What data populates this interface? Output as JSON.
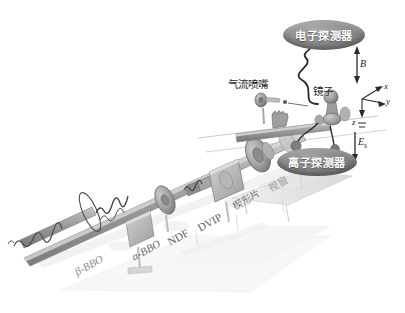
{
  "figure": {
    "kind": "optical-beamline-schematic",
    "background_color": "#ffffff"
  },
  "detectors": [
    {
      "id": "electron",
      "label": "电子探测器",
      "fill_color": "#8e8e8e",
      "text_color": "#ffffff"
    },
    {
      "id": "ion",
      "label": "离子探测器",
      "fill_color": "#878787",
      "text_color": "#ffffff"
    }
  ],
  "annotations": {
    "nozzle": "气流喷嘴",
    "mirror": "镜子",
    "wedge": "楔形片",
    "window": "视窗"
  },
  "optics": [
    {
      "id": "beta-bbo",
      "label": "β-BBO"
    },
    {
      "id": "alpha-bbo",
      "label": "α-BBO"
    },
    {
      "id": "ndf",
      "label": "NDF"
    },
    {
      "id": "dvip",
      "label": "DVIP"
    }
  ],
  "fields": [
    {
      "id": "magnetic",
      "symbol": "B",
      "subscript": "",
      "direction": "down"
    },
    {
      "id": "static-electric",
      "symbol": "E",
      "subscript": "s",
      "direction": "down"
    }
  ],
  "axes": {
    "x": "x",
    "y": "y",
    "z": "z"
  },
  "colors": {
    "beam_tube": "#9a9a9a",
    "optic_mount": "#b4b4b4",
    "table": "#d8d8d8",
    "line": "#3c3c3c",
    "shadow": "#e9e9e9"
  }
}
